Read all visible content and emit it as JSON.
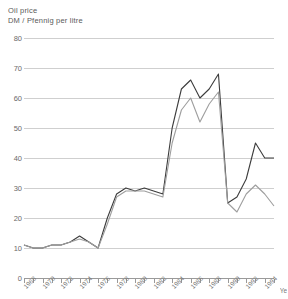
{
  "chart_data": {
    "type": "line",
    "title": "Oil price",
    "subtitle": "DM / Pfennig per litre",
    "xlabel": "Ye",
    "xlabel_full": "Year",
    "ylabel": "",
    "ylim": [
      0,
      80
    ],
    "xlim": [
      1968,
      1995
    ],
    "grid": true,
    "legend": "none",
    "y_ticks": [
      0,
      10,
      20,
      30,
      40,
      50,
      60,
      70,
      80
    ],
    "x_ticks": [
      1968,
      1969,
      1970,
      1971,
      1972,
      1973,
      1974,
      1975,
      1976,
      1977,
      1978,
      1979,
      1980,
      1981,
      1982,
      1983,
      1984,
      1985,
      1986,
      1987,
      1988,
      1989,
      1990,
      1991,
      1992,
      1993,
      1994,
      1995
    ],
    "x_tick_labels": [
      "1968",
      "1970",
      "1972",
      "1974",
      "1976",
      "1978",
      "1980",
      "1982",
      "1984",
      "1986",
      "1988",
      "1990",
      "1992",
      "1994"
    ],
    "x_tick_label_years": [
      1968,
      1970,
      1972,
      1974,
      1976,
      1978,
      1980,
      1982,
      1984,
      1986,
      1988,
      1990,
      1992,
      1994
    ],
    "x": [
      1968,
      1969,
      1970,
      1971,
      1972,
      1973,
      1974,
      1975,
      1976,
      1977,
      1978,
      1979,
      1980,
      1981,
      1982,
      1983,
      1984,
      1985,
      1986,
      1987,
      1988,
      1989,
      1990,
      1991,
      1992,
      1993,
      1994,
      1995
    ],
    "series": [
      {
        "name": "Oil price upper",
        "color": "#3c3c3c",
        "values": [
          11,
          10,
          10,
          11,
          11,
          12,
          14,
          12,
          10,
          20,
          28,
          30,
          29,
          30,
          29,
          28,
          50,
          63,
          66,
          60,
          63,
          68,
          25,
          27,
          33,
          45,
          40,
          40
        ]
      },
      {
        "name": "Oil price lower",
        "color": "#9e9e9e",
        "values": [
          11,
          10,
          10,
          11,
          11,
          12,
          13,
          12,
          10,
          18,
          27,
          29,
          29,
          29,
          28,
          27,
          45,
          56,
          60,
          52,
          58,
          62,
          25,
          22,
          28,
          31,
          28,
          24
        ]
      }
    ],
    "annotations": []
  }
}
